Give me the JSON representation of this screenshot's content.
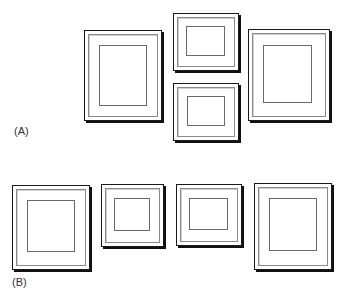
{
  "labels": {
    "a": "(A)",
    "b": "(B)"
  },
  "arrangements": [
    {
      "id": "A",
      "frames": [
        {
          "name": "large-portrait-left",
          "x": 84,
          "y": 30,
          "w": 78,
          "h": 91
        },
        {
          "name": "small-landscape-top",
          "x": 173,
          "y": 13,
          "w": 66,
          "h": 58
        },
        {
          "name": "small-landscape-bottom",
          "x": 173,
          "y": 83,
          "w": 66,
          "h": 58
        },
        {
          "name": "large-portrait-right",
          "x": 248,
          "y": 29,
          "w": 82,
          "h": 92
        }
      ]
    },
    {
      "id": "B",
      "frames": [
        {
          "name": "large-portrait-1",
          "x": 12,
          "y": 185,
          "w": 78,
          "h": 85
        },
        {
          "name": "small-square-2",
          "x": 101,
          "y": 184,
          "w": 63,
          "h": 63
        },
        {
          "name": "small-landscape-3",
          "x": 176,
          "y": 184,
          "w": 66,
          "h": 62
        },
        {
          "name": "large-portrait-4",
          "x": 254,
          "y": 183,
          "w": 78,
          "h": 87
        }
      ]
    }
  ],
  "colors": {
    "frame": "#1a1a1a",
    "shadow": "#111111",
    "mat_line": "#8a8a8a",
    "background": "#ffffff"
  }
}
